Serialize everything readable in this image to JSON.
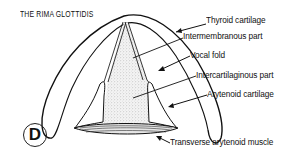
{
  "figure": {
    "title": "THE RIMA GLOTTIDIS",
    "panel_letter": "D",
    "labels": [
      {
        "id": "thyroid",
        "text": "Thyroid cartilage"
      },
      {
        "id": "intermembranous",
        "text": "Intermembranous part"
      },
      {
        "id": "vocal_fold",
        "text": "Vocal fold"
      },
      {
        "id": "intercartilaginous",
        "text": "Intercartilaginous part"
      },
      {
        "id": "arytenoid",
        "text": "Arytenoid cartilage"
      },
      {
        "id": "transverse",
        "text": "Transverse arytenoid muscle"
      }
    ]
  },
  "colors": {
    "line": "#111111",
    "stipple": "#d8d8d8",
    "background": "#ffffff"
  }
}
